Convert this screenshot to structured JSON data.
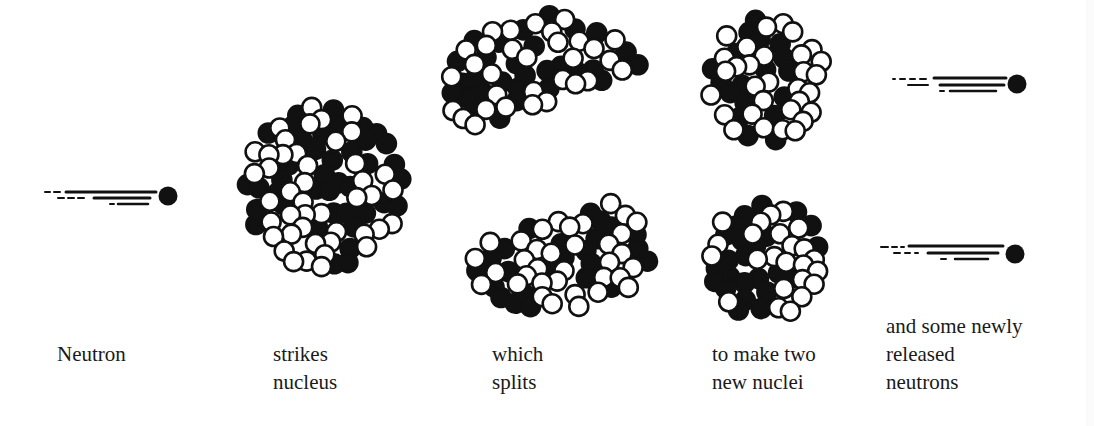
{
  "diagram": {
    "colors": {
      "background": "#ffffff",
      "ink": "#111111",
      "proton_fill": "#111111",
      "neutron_fill": "#ffffff"
    },
    "labels": [
      {
        "id": "neutron",
        "lines": [
          "Neutron"
        ],
        "x": 57,
        "y": 340
      },
      {
        "id": "strikes",
        "lines": [
          "strikes",
          "nucleus"
        ],
        "x": 273,
        "y": 340
      },
      {
        "id": "which",
        "lines": [
          "which",
          "splits"
        ],
        "x": 492,
        "y": 340
      },
      {
        "id": "to-make",
        "lines": [
          "to make two",
          "new nuclei"
        ],
        "x": 712,
        "y": 340
      },
      {
        "id": "released",
        "lines": [
          "and some newly",
          "released",
          "neutrons"
        ],
        "x": 886,
        "y": 312
      }
    ],
    "neutrons": [
      {
        "id": "incoming-neutron",
        "cx": 168,
        "cy": 196,
        "r": 9
      },
      {
        "id": "released-neutron-1",
        "cx": 1017,
        "cy": 84,
        "r": 9
      },
      {
        "id": "released-neutron-2",
        "cx": 1015,
        "cy": 254,
        "r": 9
      }
    ],
    "nuclei": [
      {
        "id": "target-nucleus",
        "shape": "circle",
        "cx": 325,
        "cy": 188,
        "rx": 78,
        "ry": 82,
        "seed": 7
      },
      {
        "id": "fragment-top",
        "shape": "half-top",
        "cx": 545,
        "cy": 85,
        "rx": 100,
        "ry": 70,
        "seed": 13
      },
      {
        "id": "fragment-bottom",
        "shape": "half-bottom",
        "cx": 555,
        "cy": 248,
        "rx": 95,
        "ry": 62,
        "seed": 21
      },
      {
        "id": "new-nucleus-1",
        "shape": "circle",
        "cx": 766,
        "cy": 80,
        "rx": 58,
        "ry": 62,
        "seed": 31
      },
      {
        "id": "new-nucleus-2",
        "shape": "circle",
        "cx": 766,
        "cy": 259,
        "rx": 58,
        "ry": 58,
        "seed": 43
      }
    ]
  }
}
